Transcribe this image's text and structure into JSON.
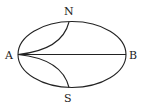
{
  "diagram": {
    "type": "geometric-figure",
    "shape": "ellipse with chord and two curved arcs",
    "colors": {
      "stroke": "#222222",
      "background": "#ffffff"
    },
    "points": {
      "A": {
        "label": "A"
      },
      "B": {
        "label": "B"
      },
      "N": {
        "label": "N"
      },
      "S": {
        "label": "S"
      }
    },
    "segments": [
      {
        "from": "A",
        "to": "B",
        "kind": "straight"
      },
      {
        "from": "A",
        "to": "N",
        "kind": "curve"
      },
      {
        "from": "A",
        "to": "S",
        "kind": "curve"
      }
    ]
  }
}
